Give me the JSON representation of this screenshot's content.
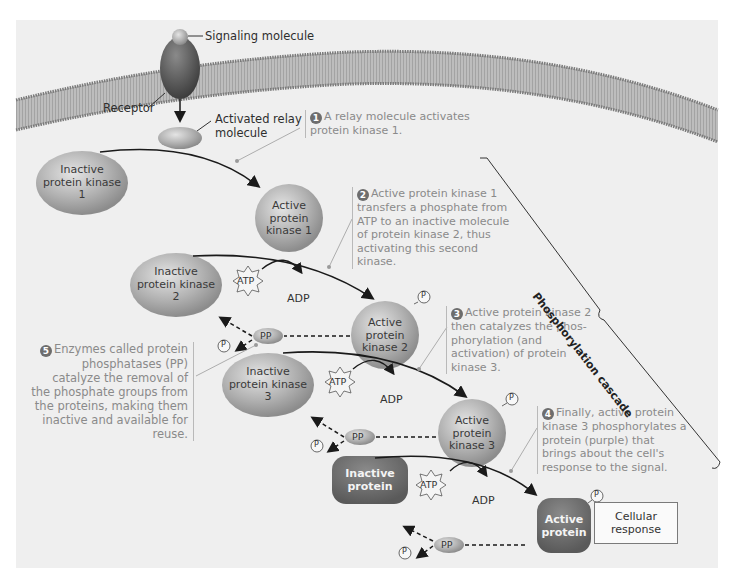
{
  "diagram": {
    "type": "signal transduction pathway",
    "colors": {
      "background": "#efefef",
      "membrane": "#8f8f8f",
      "kinase": "#a8a8a8",
      "protein": "#6e6e6e",
      "text_step": "#8a8a8a",
      "text_label": "#2e2e2e"
    }
  },
  "labels": {
    "signaling_molecule": "Signaling molecule",
    "receptor": "Receptor",
    "relay_molecule": "Activated relay molecule",
    "cascade": "Phosphorylation cascade",
    "cellular_response": "Cellular response"
  },
  "nodes": {
    "inactive_pk1": "Inactive protein kinase 1",
    "active_pk1": "Active protein kinase 1",
    "inactive_pk2": "Inactive protein kinase 2",
    "active_pk2": "Active protein kinase 2",
    "inactive_pk3": "Inactive protein kinase 3",
    "active_pk3": "Active protein kinase 3",
    "inactive_protein": "Inactive protein",
    "active_protein": "Active protein"
  },
  "molecules": {
    "atp": "ATP",
    "adp": "ADP",
    "pp": "PP",
    "p": "P",
    "pi": "i"
  },
  "steps": [
    {
      "num": "1",
      "text": "A relay molecule activates protein kinase 1."
    },
    {
      "num": "2",
      "text": "Active protein kinase 1 transfers a phosphate from ATP to an inactive molecule of protein kinase 2, thus activating this second kinase."
    },
    {
      "num": "3",
      "text": "Active protein kinase 2 then catalyzes the phos-phorylation (and activation) of protein kinase 3."
    },
    {
      "num": "4",
      "text": "Finally, active protein kinase 3 phosphorylates a protein (purple) that brings about the cell's response to the signal."
    },
    {
      "num": "5",
      "text": "Enzymes called protein phosphatases (PP) catalyze the removal of the phosphate groups from the proteins, making them inactive and available for reuse."
    }
  ]
}
